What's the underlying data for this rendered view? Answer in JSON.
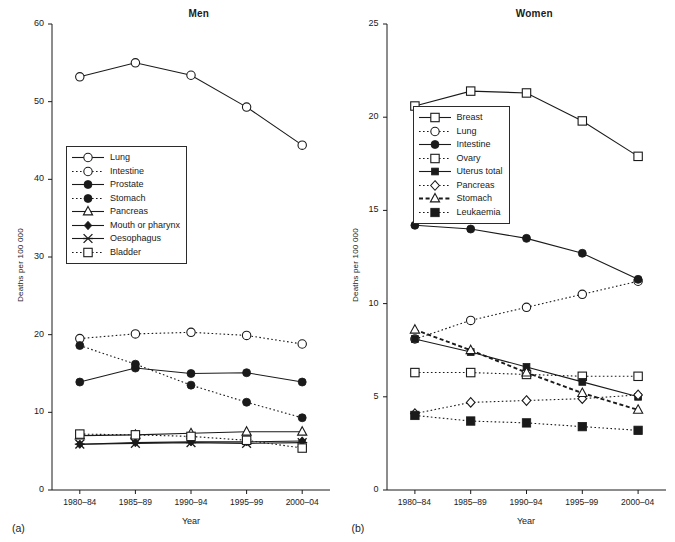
{
  "figure": {
    "axis_y_label": "Deaths per 100 000",
    "axis_x_label": "Year",
    "tag_a": "(a)",
    "tag_b": "(b)",
    "line_color": "#1a1a1a"
  },
  "chart_data": [
    {
      "type": "line",
      "title": "Men",
      "panel_tag": "(a)",
      "xlabel": "Year",
      "ylabel": "Deaths per 100 000",
      "categories": [
        "1980–84",
        "1985–89",
        "1990–94",
        "1995–99",
        "2000–04"
      ],
      "x_ticks": [
        "1980–84",
        "1985–89",
        "1990–94",
        "1995–99",
        "2000–04"
      ],
      "y_ticks": [
        0,
        10,
        20,
        30,
        40,
        50,
        60
      ],
      "ylim": [
        0,
        60
      ],
      "grid": false,
      "legend_position": "inside-left",
      "series": [
        {
          "name": "Lung",
          "marker": "circle-open",
          "line": "solid",
          "values": [
            53.2,
            55.0,
            53.4,
            49.3,
            44.4
          ]
        },
        {
          "name": "Intestine",
          "marker": "circle-open",
          "line": "dotted",
          "values": [
            19.5,
            20.1,
            20.3,
            19.9,
            18.8
          ]
        },
        {
          "name": "Prostate",
          "marker": "circle-filled",
          "line": "solid",
          "values": [
            13.9,
            15.7,
            15.0,
            15.1,
            13.9
          ]
        },
        {
          "name": "Stomach",
          "marker": "circle-filled",
          "line": "dotted",
          "values": [
            18.6,
            16.2,
            13.5,
            11.3,
            9.3
          ]
        },
        {
          "name": "Pancreas",
          "marker": "triangle-open",
          "line": "solid",
          "values": [
            7.0,
            7.1,
            7.3,
            7.5,
            7.5
          ]
        },
        {
          "name": "Mouth or pharynx",
          "marker": "diamond-filled",
          "line": "solid",
          "values": [
            5.9,
            6.1,
            6.2,
            6.2,
            6.3
          ]
        },
        {
          "name": "Oesophagus",
          "marker": "x-cross",
          "line": "solid",
          "values": [
            5.9,
            6.0,
            6.1,
            6.0,
            6.1
          ]
        },
        {
          "name": "Bladder",
          "marker": "square-open",
          "line": "dotted",
          "values": [
            7.2,
            7.1,
            6.9,
            6.4,
            5.4
          ]
        }
      ]
    },
    {
      "type": "line",
      "title": "Women",
      "panel_tag": "(b)",
      "xlabel": "Year",
      "ylabel": "Deaths per 100 000",
      "categories": [
        "1980–84",
        "1985–89",
        "1990–94",
        "1995–99",
        "2000–04"
      ],
      "x_ticks": [
        "1980–84",
        "1985–89",
        "1990–94",
        "1995–99",
        "2000–04"
      ],
      "y_ticks": [
        0,
        5,
        10,
        15,
        20,
        25
      ],
      "ylim": [
        0,
        25
      ],
      "grid": false,
      "legend_position": "inside-center",
      "series": [
        {
          "name": "Breast",
          "marker": "square-open",
          "line": "solid",
          "values": [
            20.6,
            21.4,
            21.3,
            19.8,
            17.9
          ]
        },
        {
          "name": "Lung",
          "marker": "circle-open",
          "line": "dotted",
          "values": [
            8.1,
            9.1,
            9.8,
            10.5,
            11.2
          ]
        },
        {
          "name": "Intestine",
          "marker": "circle-filled",
          "line": "solid",
          "values": [
            14.2,
            14.0,
            13.5,
            12.7,
            11.3
          ]
        },
        {
          "name": "Ovary",
          "marker": "square-open",
          "line": "dotted",
          "values": [
            6.3,
            6.3,
            6.2,
            6.1,
            6.1
          ]
        },
        {
          "name": "Uterus total",
          "marker": "square-filled",
          "line": "solid",
          "values": [
            8.1,
            7.4,
            6.6,
            5.8,
            5.0
          ]
        },
        {
          "name": "Pancreas",
          "marker": "diamond-open",
          "line": "dotted",
          "values": [
            4.1,
            4.7,
            4.8,
            4.9,
            5.1
          ]
        },
        {
          "name": "Stomach",
          "marker": "triangle-open",
          "line": "dashed",
          "values": [
            8.6,
            7.5,
            6.3,
            5.2,
            4.3
          ]
        },
        {
          "name": "Leukaemia",
          "marker": "square-filled-lg",
          "line": "dotted",
          "values": [
            4.0,
            3.7,
            3.6,
            3.4,
            3.2
          ]
        }
      ]
    }
  ]
}
